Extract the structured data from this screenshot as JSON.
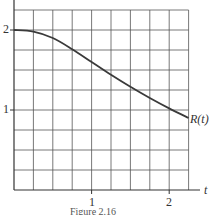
{
  "chart_data": {
    "type": "line",
    "title": "",
    "xlabel": "t",
    "ylabel": "",
    "xlim": [
      0,
      2.25
    ],
    "ylim": [
      0,
      2.375
    ],
    "x_ticks": [
      "1",
      "2"
    ],
    "y_ticks": [
      "1",
      "2"
    ],
    "grid": true,
    "grid_step": {
      "x": 0.25,
      "y": 0.25
    },
    "series": [
      {
        "name": "R(t)",
        "x": [
          0,
          0.25,
          0.5,
          0.75,
          1.0,
          1.25,
          1.5,
          1.75,
          2.0,
          2.25
        ],
        "values": [
          2.0,
          1.98,
          1.9,
          1.76,
          1.6,
          1.44,
          1.29,
          1.15,
          1.02,
          0.9
        ]
      }
    ],
    "annotations": [
      "R(t)"
    ],
    "caption": "Figure 2.16"
  },
  "labels": {
    "y_tick_2": "2",
    "y_tick_1": "1",
    "x_tick_1": "1",
    "x_tick_2": "2",
    "x_axis": "t",
    "curve": "R(t)",
    "caption": "Figure 2.16"
  }
}
